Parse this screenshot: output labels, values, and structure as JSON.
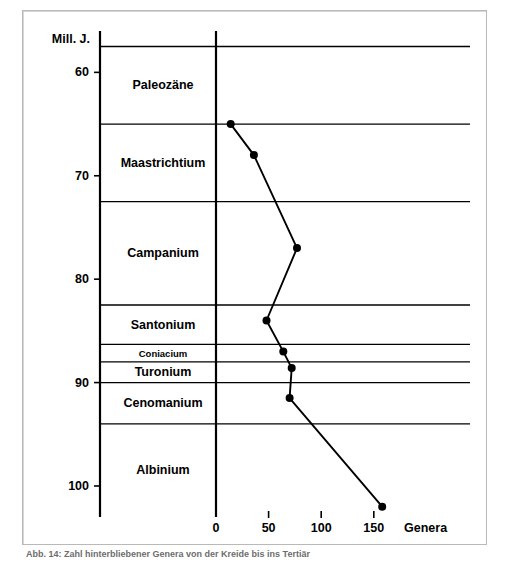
{
  "figure": {
    "caption": "Abb. 14: Zahl hinterbliebener Genera von der Kreide bis ins Tertiär"
  },
  "chart_data": {
    "type": "line",
    "title": "",
    "xlabel": "Genera",
    "ylabel": "Mill. J.",
    "xlim": [
      0,
      175
    ],
    "ylim": [
      103,
      56
    ],
    "grid": false,
    "legend": "none",
    "x_ticks": [
      0,
      50,
      100,
      150
    ],
    "x_tick_labels": [
      "0",
      "50",
      "100",
      "150"
    ],
    "y_ticks": [
      60,
      70,
      80,
      90,
      100
    ],
    "y_tick_labels": [
      "60",
      "70",
      "80",
      "90",
      "100"
    ],
    "y_axis_note": "Age in millions of years, increasing downward",
    "series": [
      {
        "name": "Genera",
        "points": [
          {
            "genera": 14,
            "age": 65.0
          },
          {
            "genera": 36,
            "age": 68.0
          },
          {
            "genera": 77,
            "age": 77.0
          },
          {
            "genera": 48,
            "age": 84.0
          },
          {
            "genera": 64,
            "age": 87.0
          },
          {
            "genera": 72,
            "age": 88.6
          },
          {
            "genera": 70,
            "age": 91.5
          },
          {
            "genera": 158,
            "age": 102.0
          }
        ]
      }
    ],
    "stages": [
      {
        "name": "Paleozäne",
        "top_age": 57.5,
        "bottom_age": 65.0,
        "thin": false
      },
      {
        "name": "Maastrichtium",
        "top_age": 65.0,
        "bottom_age": 72.5,
        "thin": false
      },
      {
        "name": "Campanium",
        "top_age": 72.5,
        "bottom_age": 82.5,
        "thin": false
      },
      {
        "name": "Santonium",
        "top_age": 82.5,
        "bottom_age": 86.3,
        "thin": false
      },
      {
        "name": "Coniacium",
        "top_age": 86.3,
        "bottom_age": 88.0,
        "thin": true
      },
      {
        "name": "Turonium",
        "top_age": 88.0,
        "bottom_age": 90.0,
        "thin": false
      },
      {
        "name": "Cenomanium",
        "top_age": 90.0,
        "bottom_age": 94.0,
        "thin": false
      },
      {
        "name": "Albinium",
        "top_age": 94.0,
        "bottom_age": 103.0,
        "thin": false
      }
    ]
  }
}
